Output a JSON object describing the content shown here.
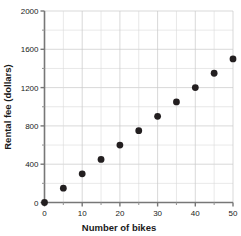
{
  "chart_data": {
    "type": "scatter",
    "title": "",
    "xlabel": "Number of bikes",
    "ylabel": "Rental fee (dollars)",
    "xlim": [
      0,
      50
    ],
    "ylim": [
      0,
      2000
    ],
    "grid": true,
    "legend": "none",
    "x": [
      0,
      5,
      10,
      15,
      20,
      25,
      30,
      35,
      40,
      45,
      50
    ],
    "values": [
      0,
      150,
      300,
      450,
      600,
      750,
      900,
      1050,
      1200,
      1350,
      1500
    ],
    "points": [
      {
        "x": 0,
        "y": 0
      },
      {
        "x": 5,
        "y": 150
      },
      {
        "x": 10,
        "y": 300
      },
      {
        "x": 15,
        "y": 450
      },
      {
        "x": 20,
        "y": 600
      },
      {
        "x": 25,
        "y": 750
      },
      {
        "x": 30,
        "y": 900
      },
      {
        "x": 35,
        "y": 1050
      },
      {
        "x": 40,
        "y": 1200
      },
      {
        "x": 45,
        "y": 1350
      },
      {
        "x": 50,
        "y": 1500
      }
    ],
    "x_ticks": [
      0,
      10,
      20,
      30,
      40,
      50
    ],
    "x_tick_labels": [
      "0",
      "10",
      "20",
      "30",
      "40",
      "50"
    ],
    "x_minor_ticks": [
      5,
      15,
      25,
      35,
      45
    ],
    "y_ticks": [
      0,
      400,
      800,
      1200,
      1600,
      2000
    ],
    "y_tick_labels": [
      "0",
      "400",
      "800",
      "1200",
      "1600",
      "2000"
    ],
    "y_minor_ticks": [
      200,
      600,
      1000,
      1400,
      1800
    ],
    "colors": {
      "point": "#231f20",
      "grid": "#c9c9c9",
      "axis": "#777777",
      "text": "#1a1a1a",
      "background": "#ffffff"
    }
  },
  "axes": {
    "x_title": "Number of bikes",
    "y_title": "Rental fee (dollars)"
  }
}
